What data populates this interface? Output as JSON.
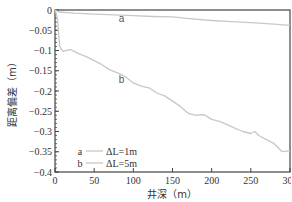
{
  "chart_data": {
    "type": "line",
    "title": "",
    "xlabel": "井深（m）",
    "ylabel": "距离偏差（m）",
    "xlim": [
      0,
      300
    ],
    "ylim": [
      -0.4,
      0
    ],
    "xticks": [
      0,
      50,
      100,
      150,
      200,
      250,
      300
    ],
    "yticks": [
      0,
      -0.05,
      -0.1,
      -0.15,
      -0.2,
      -0.25,
      -0.3,
      -0.35,
      -0.4
    ],
    "xtick_labels": [
      "0",
      "50",
      "100",
      "150",
      "200",
      "250",
      "300"
    ],
    "ytick_labels": [
      "0",
      "−0.05",
      "−0.1",
      "−0.15",
      "−0.2",
      "−0.25",
      "−0.3",
      "−0.35",
      "−0.4"
    ],
    "grid": false,
    "legend_position": "lower-left inside",
    "series": [
      {
        "name": "a",
        "legend_label": "ΔL=1m",
        "color": "#c8c8c8",
        "x": [
          0,
          5,
          25,
          50,
          75,
          100,
          125,
          150,
          175,
          200,
          225,
          250,
          275,
          300
        ],
        "y": [
          0,
          -0.005,
          -0.008,
          -0.01,
          -0.012,
          -0.014,
          -0.016,
          -0.017,
          -0.022,
          -0.026,
          -0.029,
          -0.031,
          -0.034,
          -0.038
        ]
      },
      {
        "name": "b",
        "legend_label": "ΔL=5m",
        "color": "#c8c8c8",
        "x": [
          0,
          3,
          6,
          10,
          14,
          20,
          25,
          30,
          40,
          50,
          60,
          70,
          80,
          90,
          100,
          110,
          120,
          130,
          140,
          150,
          160,
          170,
          180,
          190,
          200,
          210,
          220,
          230,
          240,
          250,
          255,
          260,
          270,
          280,
          290,
          300
        ],
        "y": [
          0,
          -0.02,
          -0.09,
          -0.102,
          -0.1,
          -0.098,
          -0.103,
          -0.108,
          -0.115,
          -0.125,
          -0.135,
          -0.148,
          -0.155,
          -0.165,
          -0.18,
          -0.188,
          -0.192,
          -0.205,
          -0.212,
          -0.225,
          -0.238,
          -0.255,
          -0.26,
          -0.258,
          -0.27,
          -0.275,
          -0.283,
          -0.292,
          -0.3,
          -0.305,
          -0.3,
          -0.31,
          -0.32,
          -0.33,
          -0.35,
          -0.348
        ]
      }
    ],
    "annotations": [
      {
        "text": "a",
        "x": 85,
        "y": -0.02
      },
      {
        "text": "b",
        "x": 85,
        "y": -0.17
      }
    ]
  }
}
